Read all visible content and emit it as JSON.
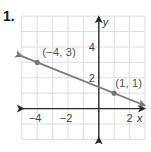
{
  "problem": {
    "number": "1."
  },
  "chart_data": {
    "type": "line",
    "title": "",
    "xlabel": "x",
    "ylabel": "y",
    "xlim": [
      -5,
      3
    ],
    "ylim": [
      -2,
      6
    ],
    "grid": true,
    "x_ticks": [
      {
        "value": -4,
        "label": "−4"
      },
      {
        "value": -2,
        "label": "−2"
      },
      {
        "value": 2,
        "label": "2"
      }
    ],
    "y_ticks": [
      {
        "value": 2,
        "label": "2"
      },
      {
        "value": 4,
        "label": "4"
      }
    ],
    "series": [
      {
        "name": "line",
        "points": [
          {
            "x": -4,
            "y": 3,
            "label": "(−4, 3)"
          },
          {
            "x": 1,
            "y": 1,
            "label": "(1, 1)"
          }
        ],
        "slope": -0.4,
        "intercept": 1.4,
        "arrows": "both"
      }
    ],
    "colors": {
      "grid": "#dddddd",
      "axis": "#2a2a2a",
      "line": "#7a7a7a",
      "point": "#777777"
    }
  }
}
